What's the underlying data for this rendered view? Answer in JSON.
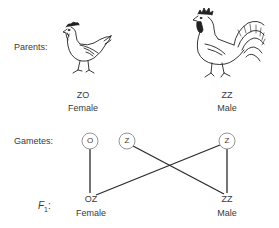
{
  "row_labels": {
    "parents": "Parents:",
    "gametes": "Gametes:",
    "f1_letter": "F",
    "f1_sub": "1",
    "f1_colon": ":"
  },
  "parents": [
    {
      "id": "hen",
      "genotype": "ZO",
      "sex": "Female",
      "icon": "hen-icon"
    },
    {
      "id": "rooster",
      "genotype": "ZZ",
      "sex": "Male",
      "icon": "rooster-icon"
    }
  ],
  "gametes": [
    {
      "label": "O",
      "from": "hen"
    },
    {
      "label": "Z",
      "from": "hen"
    },
    {
      "label": "Z",
      "from": "rooster"
    }
  ],
  "offspring": [
    {
      "genotype": "OZ",
      "sex": "Female"
    },
    {
      "genotype": "ZZ",
      "sex": "Male"
    }
  ],
  "colors": {
    "line": "#2b2b2b",
    "circle": "#777777",
    "text": "#3a3a3a"
  }
}
